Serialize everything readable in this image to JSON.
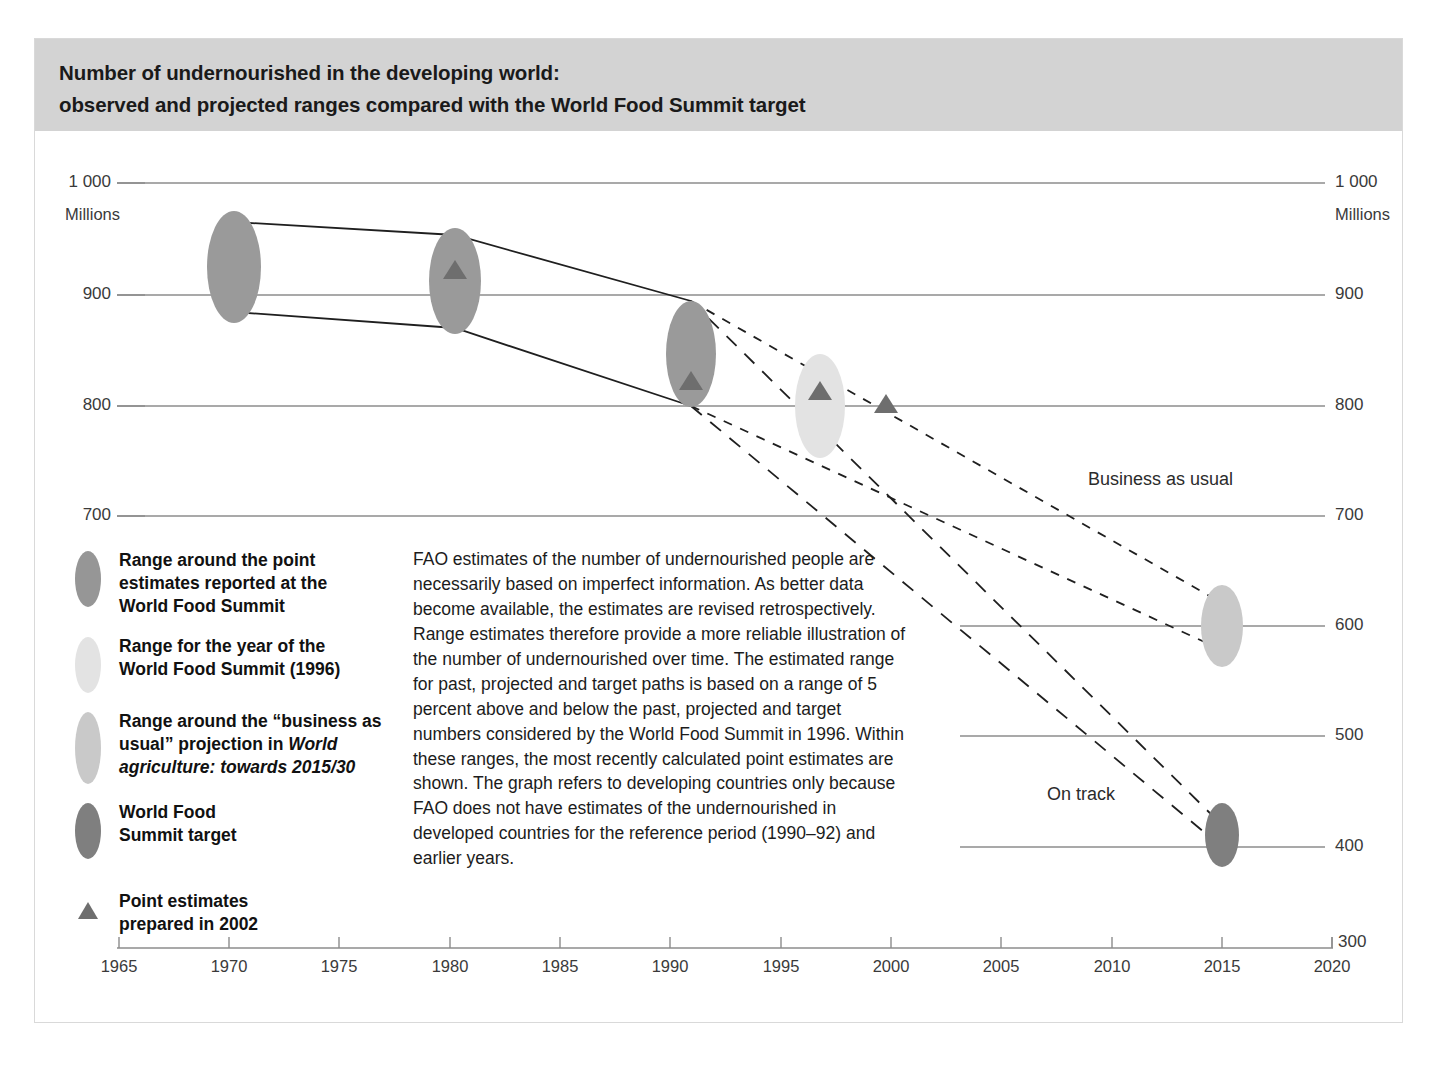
{
  "title": {
    "line1": "Number of undernourished in the developing world:",
    "line2": "observed and projected ranges compared with the World Food Summit target"
  },
  "axes": {
    "left_unit": "Millions",
    "right_unit": "Millions",
    "y_ticks_left": [
      "1 000",
      "900",
      "800",
      "700"
    ],
    "y_ticks_right": [
      "1 000",
      "900",
      "800",
      "700",
      "600",
      "500",
      "400",
      "300"
    ],
    "x_ticks": [
      "1965",
      "1970",
      "1975",
      "1980",
      "1985",
      "1990",
      "1995",
      "2000",
      "2005",
      "2010",
      "2015",
      "2020"
    ]
  },
  "annotations": {
    "business_as_usual": "Business as usual",
    "on_track": "On track"
  },
  "legend": {
    "items": [
      {
        "name": "range-wfs-point-estimates",
        "color": "#969696",
        "shape": "ellipse",
        "lines": [
          "Range around the point",
          "estimates reported at the",
          "World Food Summit"
        ]
      },
      {
        "name": "range-wfs-year-1996",
        "color": "#e3e3e3",
        "shape": "ellipse",
        "lines": [
          "Range for the year of the",
          "World Food Summit (1996)"
        ]
      },
      {
        "name": "range-business-as-usual",
        "color": "#c9c9c9",
        "shape": "ellipse",
        "lines_html": "Range around the “business as usual” projection in <em>World agriculture: towards 2015/30</em>"
      },
      {
        "name": "world-food-summit-target",
        "color": "#7f7f7f",
        "shape": "ellipse",
        "lines": [
          "World Food",
          "Summit target"
        ]
      },
      {
        "name": "point-estimates-2002",
        "color": "#6e6e6e",
        "shape": "triangle",
        "lines": [
          "Point estimates",
          "prepared in 2002"
        ]
      }
    ]
  },
  "body_text": "FAO estimates of the number of undernourished people are necessarily based on imperfect information. As better data become available, the estimates are revised retrospectively. Range estimates therefore provide a more reliable illustration of the number of undernourished over time. The estimated range for past, projected and target paths is based on a range of 5 percent above and below the past, projected and target numbers considered by the World Food Summit in 1996. Within these ranges, the most recently calculated point estimates are shown. The graph refers to developing countries only because FAO does not have estimates of the undernourished in developed countries for the reference period (1990–92) and earlier years.",
  "chart_data": {
    "type": "line",
    "title": "Number of undernourished in the developing world: observed and projected ranges compared with the World Food Summit target",
    "xlabel": "",
    "ylabel": "Millions",
    "xlim": [
      1963,
      2021
    ],
    "ylim": [
      300,
      1000
    ],
    "grid": true,
    "y_gridlines": [
      1000,
      900,
      800,
      700,
      600,
      500,
      400,
      300
    ],
    "x_ticks": [
      1965,
      1970,
      1975,
      1980,
      1985,
      1990,
      1995,
      2000,
      2005,
      2010,
      2015,
      2020
    ],
    "legend_position": "lower-left",
    "series": [
      {
        "name": "Observed range (reported at World Food Summit)",
        "style": "solid-band",
        "color": "#969696",
        "x": [
          1970,
          1980,
          1991
        ],
        "upper": [
          957,
          945,
          886
        ],
        "lower": [
          876,
          862,
          800
        ],
        "center": [
          916,
          920,
          820
        ]
      },
      {
        "name": "Business as usual projection range",
        "style": "dashed-band",
        "color": "#c9c9c9",
        "x": [
          1991,
          2015
        ],
        "upper": [
          886,
          620
        ],
        "lower": [
          800,
          578
        ],
        "center": [
          820,
          600
        ]
      },
      {
        "name": "World Food Summit target range",
        "style": "dashed-band",
        "color": "#7f7f7f",
        "x": [
          1991,
          2015
        ],
        "upper": [
          886,
          420
        ],
        "lower": [
          800,
          400
        ],
        "center": [
          820,
          410
        ]
      },
      {
        "name": "Range for the year of the World Food Summit (1996)",
        "style": "ellipse",
        "color": "#e3e3e3",
        "x": [
          1996
        ],
        "upper": [
          851
        ],
        "lower": [
          763
        ],
        "center": [
          811
        ]
      }
    ],
    "point_estimates_2002": {
      "name": "Point estimates prepared in 2002",
      "marker": "triangle",
      "color": "#6e6e6e",
      "x": [
        1980,
        1991,
        1996,
        1999
      ],
      "y": [
        920,
        820,
        811,
        800
      ]
    },
    "annotations": [
      {
        "text": "Business as usual",
        "x": 2009,
        "ynominal": 678
      },
      {
        "text": "On track",
        "x": 2007,
        "ynominal": 441
      }
    ]
  }
}
